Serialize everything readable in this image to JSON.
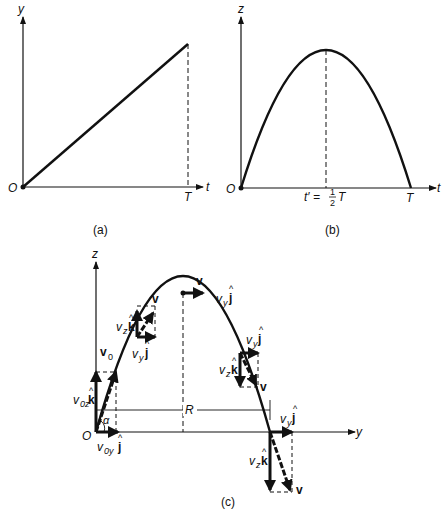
{
  "figure": {
    "panels": [
      {
        "id": "a",
        "caption": "(a)",
        "x_axis_label": "t",
        "y_axis_label": "y",
        "origin_label": "O",
        "x_tick_label": "T",
        "curve": "straight line from origin rising to (T, y_max)"
      },
      {
        "id": "b",
        "caption": "(b)",
        "x_axis_label": "t",
        "y_axis_label": "z",
        "origin_label": "O",
        "x_tick_labels": [
          "t′ = ½T",
          "T"
        ],
        "peak_label_prefix": "t′ =",
        "peak_label_frac_num": "1",
        "peak_label_frac_den": "2",
        "peak_label_suffix": "T",
        "end_label": "T",
        "curve": "parabola from O to T with peak at T/2"
      },
      {
        "id": "c",
        "caption": "(c)",
        "x_axis_label": "y",
        "y_axis_label": "z",
        "origin_label": "O",
        "angle_label": "α",
        "range_label": "R",
        "vector_labels": {
          "v0": "v",
          "v0_sub": "0",
          "v0z": "v",
          "v0z_sub": "0z",
          "k_hat": "k",
          "v0y": "v",
          "v0y_sub": "0y",
          "j_hat": "j",
          "v": "v",
          "vz": "v",
          "vz_sub": "z",
          "vy": "v",
          "vy_sub": "y",
          "hat": "^"
        }
      }
    ]
  }
}
